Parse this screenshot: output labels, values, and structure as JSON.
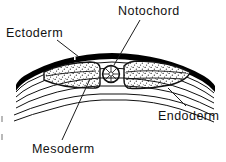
{
  "figure": {
    "type": "anatomical-line-diagram",
    "background_color": "#ffffff",
    "ink_color": "#000000",
    "stipple_color": "#1a1a1a",
    "leader_line_color": "#1c1c1c",
    "width": 226,
    "height": 162
  },
  "labels": {
    "ectoderm": "Ectoderm",
    "notochord": "Notochord",
    "endoderm": "Endoderm",
    "mesoderm": "Mesoderm"
  },
  "structures": [
    {
      "name": "ectoderm",
      "label": "Ectoderm",
      "description": "Thick solid black arc forming the dorsal outer layer",
      "fill": "#000000",
      "position": "top"
    },
    {
      "name": "notochord",
      "label": "Notochord",
      "description": "Small circle with radial hatching at the midline",
      "fill": "#ffffff",
      "position": "center",
      "center_x": 111,
      "center_y": 74,
      "radius": 8
    },
    {
      "name": "mesoderm",
      "label": "Mesoderm",
      "description": "Two stippled lens-shaped blocks flanking the notochord",
      "fill": "#ffffff",
      "pattern": "stipple",
      "position": "flanking-center"
    },
    {
      "name": "endoderm",
      "label": "Endoderm",
      "description": "Series of thin parallel arcs forming the ventral layer",
      "fill": "none",
      "position": "bottom"
    }
  ],
  "leader_lines": [
    {
      "name": "ectoderm-leader",
      "from_label": "Ectoderm",
      "x1": 57,
      "y1": 40,
      "x2": 79,
      "y2": 57
    },
    {
      "name": "notochord-leader",
      "from_label": "Notochord",
      "x1": 140,
      "y1": 20,
      "x2": 114,
      "y2": 65
    },
    {
      "name": "endoderm-leader",
      "from_label": "Endoderm",
      "x1": 186,
      "y1": 106,
      "x2": 168,
      "y2": 88
    },
    {
      "name": "mesoderm-leader",
      "from_label": "Mesoderm",
      "x1": 62,
      "y1": 140,
      "x2": 90,
      "y2": 79
    }
  ]
}
